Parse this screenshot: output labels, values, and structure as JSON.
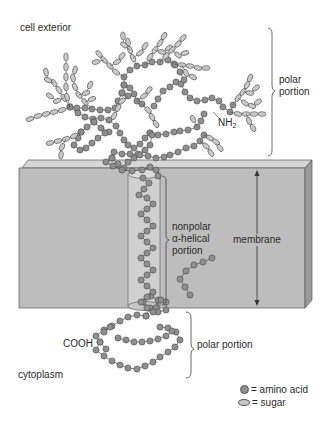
{
  "labels": {
    "cell_exterior": "cell exterior",
    "polar_portion_top_line1": "polar",
    "polar_portion_top_line2": "portion",
    "nh2_main": "NH",
    "nh2_sub": "2",
    "nonpolar_line1": "nonpolar",
    "nonpolar_line2": "α-helical",
    "nonpolar_line3": "portion",
    "membrane": "membrane",
    "cooh": "COOH",
    "polar_portion_bottom": "polar portion",
    "cytoplasm": "cytoplasm"
  },
  "legend": {
    "amino_acid": "= amino acid",
    "sugar": "= sugar"
  },
  "colors": {
    "amino_acid_fill": "#8f8f8f",
    "sugar_fill": "#c9c9c9",
    "outline": "#4a4a4a",
    "membrane_front": "#bdbdbd",
    "membrane_top": "#d6d6d6",
    "membrane_side": "#9a9a9a",
    "helix_cylinder": "#d0d0d0"
  },
  "structure": {
    "amino_acid_chains": [
      [
        [
          190,
          295
        ],
        [
          185,
          287
        ],
        [
          180,
          279
        ],
        [
          186,
          271
        ],
        [
          194,
          265
        ],
        [
          203,
          262
        ],
        [
          212,
          258
        ]
      ],
      [
        [
          96,
          336
        ],
        [
          104,
          330
        ],
        [
          112,
          326
        ],
        [
          120,
          321
        ],
        [
          128,
          317
        ],
        [
          137,
          315
        ],
        [
          146,
          316
        ]
      ],
      [
        [
          100,
          342
        ],
        [
          96,
          350
        ],
        [
          104,
          356
        ],
        [
          112,
          361
        ],
        [
          120,
          365
        ],
        [
          128,
          368
        ],
        [
          137,
          369
        ],
        [
          145,
          366
        ],
        [
          153,
          362
        ],
        [
          160,
          357
        ],
        [
          168,
          352
        ],
        [
          175,
          347
        ],
        [
          180,
          340
        ],
        [
          176,
          332
        ],
        [
          168,
          328
        ],
        [
          160,
          327
        ]
      ],
      [
        [
          100,
          342
        ],
        [
          106,
          349
        ]
      ],
      [
        [
          118,
          338
        ],
        [
          126,
          340
        ],
        [
          134,
          342
        ],
        [
          142,
          342
        ],
        [
          150,
          341
        ],
        [
          158,
          339
        ],
        [
          166,
          336
        ],
        [
          172,
          331
        ]
      ],
      [
        [
          146,
          316
        ],
        [
          150,
          308
        ],
        [
          143,
          302
        ],
        [
          151,
          296
        ],
        [
          158,
          300
        ],
        [
          156,
          308
        ]
      ],
      [
        [
          156,
          308
        ],
        [
          161,
          300
        ],
        [
          166,
          302
        ],
        [
          166,
          310
        ],
        [
          158,
          312
        ]
      ],
      [
        [
          110,
          327
        ],
        [
          104,
          332
        ]
      ],
      [
        [
          70,
          107
        ],
        [
          77,
          108
        ],
        [
          85,
          108
        ],
        [
          92,
          109
        ],
        [
          100,
          110
        ],
        [
          108,
          110
        ],
        [
          115,
          108
        ],
        [
          118,
          101
        ],
        [
          122,
          93
        ],
        [
          124,
          85
        ],
        [
          124,
          77
        ],
        [
          130,
          70
        ],
        [
          137,
          66
        ],
        [
          145,
          65
        ],
        [
          152,
          62
        ],
        [
          160,
          62
        ],
        [
          168,
          60
        ],
        [
          174,
          64
        ]
      ],
      [
        [
          70,
          107
        ],
        [
          78,
          113
        ],
        [
          85,
          117
        ],
        [
          93,
          119
        ],
        [
          101,
          118
        ],
        [
          109,
          120
        ],
        [
          116,
          126
        ],
        [
          120,
          133
        ],
        [
          124,
          140
        ],
        [
          128,
          145
        ],
        [
          134,
          148
        ],
        [
          140,
          144
        ],
        [
          145,
          138
        ],
        [
          150,
          133
        ]
      ],
      [
        [
          124,
          85
        ],
        [
          130,
          88
        ],
        [
          134,
          94
        ],
        [
          137,
          101
        ],
        [
          142,
          104
        ]
      ],
      [
        [
          122,
          93
        ],
        [
          128,
          96
        ]
      ],
      [
        [
          154,
          106
        ],
        [
          158,
          99
        ],
        [
          163,
          91
        ],
        [
          170,
          87
        ],
        [
          176,
          82
        ]
      ],
      [
        [
          181,
          84
        ],
        [
          185,
          92
        ],
        [
          190,
          98
        ],
        [
          197,
          101
        ],
        [
          205,
          100
        ],
        [
          212,
          98
        ],
        [
          219,
          101
        ],
        [
          223,
          107
        ],
        [
          230,
          112
        ],
        [
          233,
          105
        ]
      ],
      [
        [
          175,
          65
        ],
        [
          180,
          72
        ],
        [
          184,
          80
        ]
      ],
      [
        [
          150,
          133
        ],
        [
          158,
          135
        ],
        [
          166,
          134
        ],
        [
          174,
          132
        ],
        [
          180,
          131
        ],
        [
          188,
          130
        ],
        [
          197,
          127
        ],
        [
          201,
          121
        ],
        [
          204,
          114
        ]
      ],
      [
        [
          81,
          132
        ],
        [
          87,
          127
        ],
        [
          94,
          122
        ]
      ],
      [
        [
          94,
          122
        ],
        [
          101,
          128
        ],
        [
          109,
          132
        ]
      ],
      [
        [
          152,
          135
        ],
        [
          150,
          145
        ],
        [
          145,
          150
        ],
        [
          138,
          154
        ],
        [
          130,
          154
        ],
        [
          122,
          154
        ],
        [
          114,
          152
        ]
      ],
      [
        [
          105,
          133
        ],
        [
          98,
          138
        ],
        [
          92,
          143
        ],
        [
          86,
          148
        ],
        [
          80,
          150
        ],
        [
          74,
          145
        ],
        [
          78,
          138
        ],
        [
          81,
          132
        ]
      ],
      [
        [
          112,
          158
        ],
        [
          118,
          164
        ],
        [
          124,
          168
        ],
        [
          128,
          162
        ],
        [
          134,
          158
        ],
        [
          140,
          155
        ],
        [
          148,
          156
        ],
        [
          156,
          158
        ],
        [
          164,
          157
        ],
        [
          170,
          155
        ],
        [
          178,
          152
        ],
        [
          186,
          148
        ],
        [
          194,
          146
        ],
        [
          200,
          141
        ],
        [
          204,
          135
        ]
      ],
      [
        [
          112,
          158
        ],
        [
          106,
          162
        ],
        [
          113,
          166
        ],
        [
          122,
          170
        ],
        [
          132,
          171
        ],
        [
          142,
          170
        ],
        [
          150,
          167
        ],
        [
          156,
          170
        ],
        [
          158,
          176
        ]
      ]
    ],
    "helix": [
      [
        143,
        178
      ],
      [
        149,
        183
      ],
      [
        144,
        189
      ],
      [
        139,
        195
      ],
      [
        147,
        198
      ],
      [
        153,
        204
      ],
      [
        147,
        209
      ],
      [
        141,
        214
      ],
      [
        147,
        220
      ],
      [
        153,
        226
      ],
      [
        147,
        231
      ],
      [
        141,
        236
      ],
      [
        147,
        242
      ],
      [
        153,
        248
      ],
      [
        147,
        253
      ],
      [
        141,
        258
      ],
      [
        147,
        264
      ],
      [
        153,
        270
      ],
      [
        147,
        275
      ],
      [
        141,
        280
      ],
      [
        147,
        286
      ],
      [
        153,
        292
      ],
      [
        147,
        297
      ],
      [
        141,
        302
      ],
      [
        147,
        308
      ],
      [
        153,
        312
      ]
    ],
    "sugar_branches": [
      {
        "from": [
          70,
          107
        ],
        "beads": [
          [
            62,
            110
          ],
          [
            54,
            112
          ],
          [
            46,
            114
          ],
          [
            38,
            116
          ],
          [
            30,
            119
          ]
        ]
      },
      {
        "from": [
          70,
          107
        ],
        "beads": [
          [
            64,
            98
          ],
          [
            59,
            90
          ],
          [
            54,
            83
          ]
        ]
      },
      {
        "from": [
          64,
          98
        ],
        "beads": [
          [
            57,
            101
          ],
          [
            50,
            96
          ]
        ]
      },
      {
        "from": [
          54,
          83
        ],
        "beads": [
          [
            48,
            80
          ],
          [
            46,
            72
          ]
        ]
      },
      {
        "from": [
          70,
          107
        ],
        "beads": [
          [
            67,
            97
          ],
          [
            66,
            87
          ],
          [
            66,
            77
          ],
          [
            66,
            67
          ],
          [
            66,
            57
          ]
        ]
      },
      {
        "from": [
          81,
          132
        ],
        "beads": [
          [
            74,
            136
          ],
          [
            66,
            139
          ],
          [
            58,
            141
          ],
          [
            50,
            143
          ]
        ]
      },
      {
        "from": [
          66,
          139
        ],
        "beads": [
          [
            62,
            147
          ],
          [
            61,
            155
          ]
        ]
      },
      {
        "from": [
          92,
          109
        ],
        "beads": [
          [
            85,
            102
          ],
          [
            79,
            95
          ],
          [
            75,
            87
          ],
          [
            73,
            78
          ],
          [
            75,
            70
          ]
        ]
      },
      {
        "from": [
          79,
          95
        ],
        "beads": [
          [
            86,
            93
          ],
          [
            90,
            85
          ]
        ]
      },
      {
        "from": [
          85,
          102
        ],
        "beads": [
          [
            92,
            99
          ]
        ]
      },
      {
        "from": [
          124,
          77
        ],
        "beads": [
          [
            116,
            72
          ],
          [
            110,
            66
          ],
          [
            104,
            60
          ],
          [
            99,
            54
          ]
        ]
      },
      {
        "from": [
          110,
          66
        ],
        "beads": [
          [
            117,
            62
          ],
          [
            122,
            56
          ]
        ]
      },
      {
        "from": [
          104,
          60
        ],
        "beads": [
          [
            96,
            62
          ]
        ]
      },
      {
        "from": [
          137,
          66
        ],
        "beads": [
          [
            133,
            58
          ],
          [
            130,
            50
          ],
          [
            128,
            42
          ]
        ]
      },
      {
        "from": [
          130,
          50
        ],
        "beads": [
          [
            124,
            45
          ],
          [
            123,
            36
          ]
        ]
      },
      {
        "from": [
          133,
          58
        ],
        "beads": [
          [
            140,
            53
          ],
          [
            145,
            46
          ]
        ]
      },
      {
        "from": [
          145,
          65
        ],
        "beads": [
          [
            150,
            57
          ],
          [
            155,
            50
          ],
          [
            160,
            43
          ],
          [
            164,
            36
          ]
        ]
      },
      {
        "from": [
          155,
          50
        ],
        "beads": [
          [
            162,
            52
          ],
          [
            169,
            48
          ]
        ]
      },
      {
        "from": [
          160,
          62
        ],
        "beads": [
          [
            166,
            56
          ],
          [
            172,
            50
          ],
          [
            178,
            44
          ],
          [
            183,
            38
          ]
        ]
      },
      {
        "from": [
          172,
          50
        ],
        "beads": [
          [
            178,
            55
          ],
          [
            185,
            53
          ]
        ]
      },
      {
        "from": [
          174,
          64
        ],
        "beads": [
          [
            182,
            65
          ],
          [
            190,
            66
          ],
          [
            198,
            68
          ],
          [
            206,
            68
          ]
        ]
      },
      {
        "from": [
          182,
          65
        ],
        "beads": [
          [
            186,
            73
          ],
          [
            193,
            77
          ]
        ]
      },
      {
        "from": [
          128,
          96
        ],
        "beads": [
          [
            122,
            101
          ],
          [
            118,
            108
          ],
          [
            114,
            116
          ]
        ]
      },
      {
        "from": [
          137,
          101
        ],
        "beads": [
          [
            144,
            96
          ],
          [
            149,
            90
          ]
        ]
      },
      {
        "from": [
          142,
          104
        ],
        "beads": [
          [
            148,
            110
          ],
          [
            152,
            117
          ],
          [
            156,
            124
          ]
        ]
      },
      {
        "from": [
          233,
          105
        ],
        "beads": [
          [
            238,
            98
          ],
          [
            243,
            92
          ],
          [
            247,
            85
          ],
          [
            250,
            78
          ]
        ]
      },
      {
        "from": [
          243,
          92
        ],
        "beads": [
          [
            250,
            93
          ],
          [
            256,
            88
          ]
        ]
      },
      {
        "from": [
          238,
          98
        ],
        "beads": [
          [
            245,
            103
          ],
          [
            252,
            106
          ],
          [
            258,
            102
          ]
        ]
      },
      {
        "from": [
          230,
          112
        ],
        "beads": [
          [
            238,
            114
          ],
          [
            246,
            114
          ],
          [
            254,
            114
          ],
          [
            262,
            114
          ]
        ]
      },
      {
        "from": [
          246,
          114
        ],
        "beads": [
          [
            249,
            121
          ],
          [
            253,
            128
          ]
        ]
      },
      {
        "from": [
          200,
          141
        ],
        "beads": [
          [
            206,
            146
          ],
          [
            211,
            153
          ]
        ]
      },
      {
        "from": [
          204,
          135
        ],
        "beads": [
          [
            210,
            138
          ],
          [
            216,
            142
          ],
          [
            220,
            148
          ]
        ]
      },
      {
        "from": [
          197,
          127
        ],
        "beads": [
          [
            193,
            119
          ]
        ]
      }
    ]
  }
}
